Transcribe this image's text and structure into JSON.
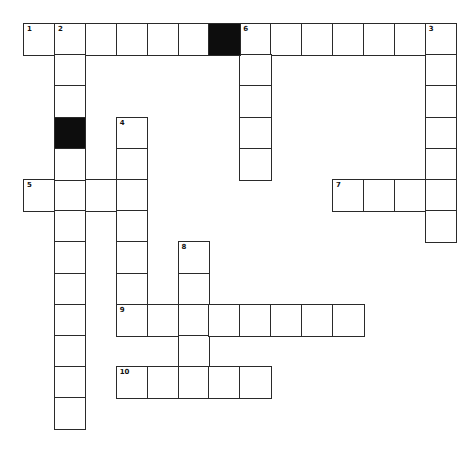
{
  "puzzle": {
    "type": "crossword",
    "origin": [
      23,
      23
    ],
    "cell_w": 30.9,
    "cell_h": 31.2,
    "colors": {
      "border": "#2a2a2a",
      "fill": "#ffffff",
      "block": "#0d0d0d"
    },
    "entries": [
      {
        "number": "1",
        "direction": "across",
        "row": 0,
        "col": 0,
        "length": 6
      },
      {
        "number": "2",
        "direction": "down",
        "row": 0,
        "col": 1,
        "length": 3
      },
      {
        "number": "6",
        "direction": "across",
        "row": 0,
        "col": 7,
        "length": 7
      },
      {
        "number": "6",
        "direction": "down",
        "row": 0,
        "col": 7,
        "length": 5
      },
      {
        "number": "3",
        "direction": "down",
        "row": 0,
        "col": 13,
        "length": 7
      },
      {
        "number": "4",
        "direction": "down",
        "row": 3,
        "col": 3,
        "length": 7
      },
      {
        "number": "5",
        "direction": "across",
        "row": 5,
        "col": 0,
        "length": 4
      },
      {
        "number": "7",
        "direction": "across",
        "row": 5,
        "col": 10,
        "length": 4
      },
      {
        "number": "8",
        "direction": "down",
        "row": 7,
        "col": 5,
        "length": 5
      },
      {
        "number": "9",
        "direction": "across",
        "row": 9,
        "col": 3,
        "length": 8
      },
      {
        "number": "10",
        "direction": "across",
        "row": 11,
        "col": 3,
        "length": 5
      }
    ],
    "extra_cells": [
      {
        "row": 4,
        "col": 1,
        "length_down": 9
      }
    ],
    "black_cells": [
      [
        0,
        6
      ],
      [
        3,
        1
      ]
    ]
  }
}
